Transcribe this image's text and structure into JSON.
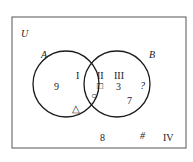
{
  "diagram": {
    "type": "venn",
    "universe_label": "U",
    "sets": [
      {
        "name": "A",
        "label": "A"
      },
      {
        "name": "B",
        "label": "B"
      }
    ],
    "regions": [
      {
        "id": "I",
        "label": "I",
        "description": "A only",
        "elements": [
          "9",
          "△"
        ]
      },
      {
        "id": "II",
        "label": "II",
        "description": "A and B",
        "elements": [
          "□",
          "○"
        ]
      },
      {
        "id": "III",
        "label": "III",
        "description": "B only",
        "elements": [
          "3",
          "?",
          "7"
        ]
      },
      {
        "id": "IV",
        "label": "IV",
        "description": "outside A and B",
        "elements": [
          "8",
          "#"
        ]
      }
    ],
    "text": {
      "u": "U",
      "a": "A",
      "b": "B",
      "region_I": "I",
      "region_II": "II",
      "region_III": "III",
      "region_IV": "IV",
      "el_9": "9",
      "el_triangle": "△",
      "el_square": "□",
      "el_circle": "○",
      "el_3": "3",
      "el_q": "?",
      "el_7": "7",
      "el_8": "8",
      "el_hash": "#"
    },
    "colors": {
      "stroke": "#1a1a1a",
      "background": "#ffffff",
      "frame": "#555555"
    }
  }
}
